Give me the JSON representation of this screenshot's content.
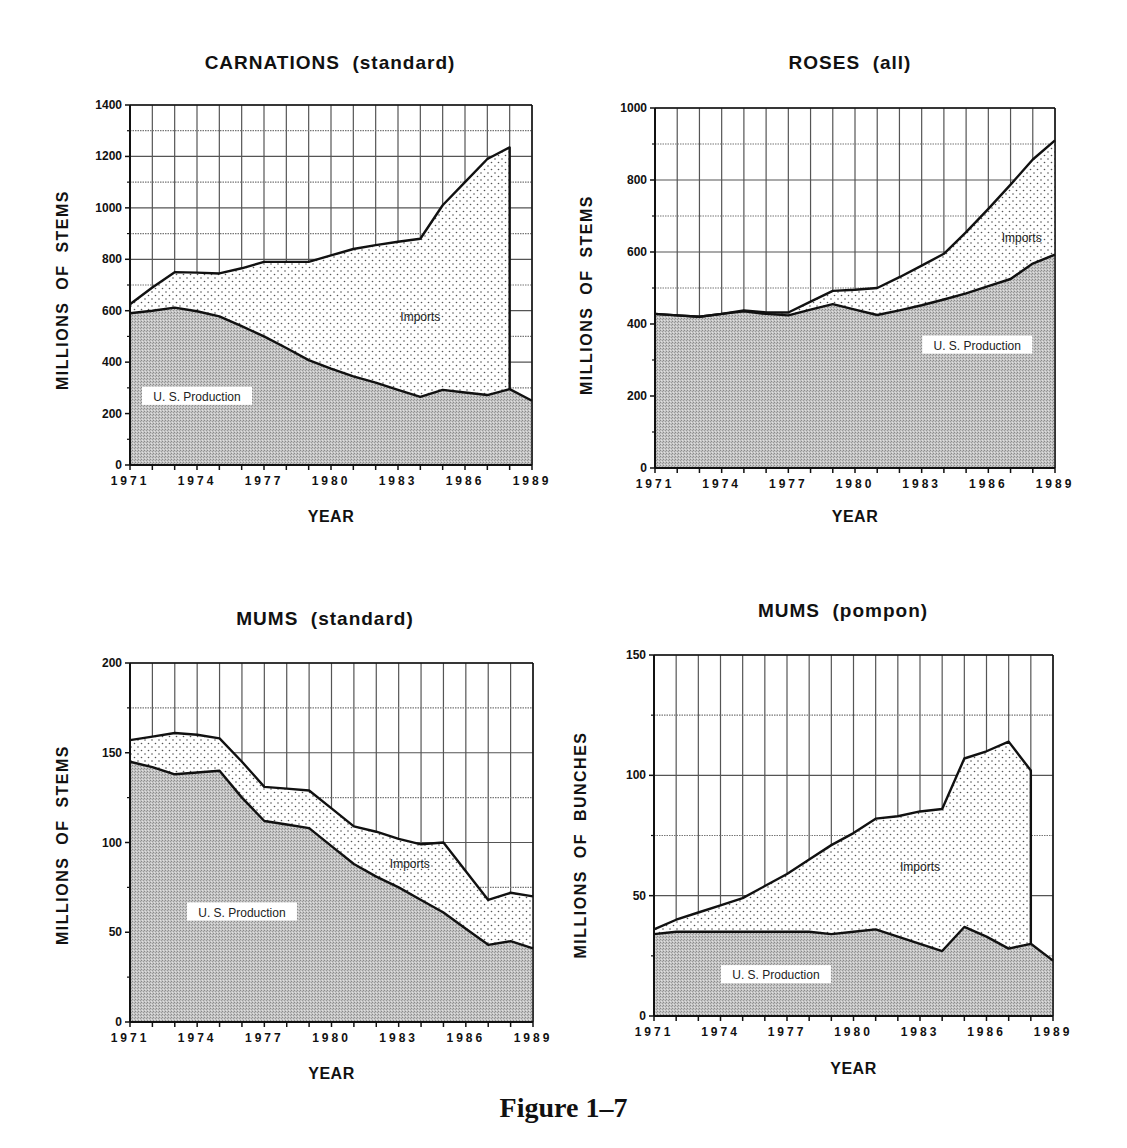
{
  "figure": {
    "caption": "Figure 1–7"
  },
  "labels": {
    "us_production": "U. S. Production",
    "imports": "Imports"
  },
  "chart_data": [
    {
      "id": "carnations",
      "type": "area",
      "stacked": true,
      "title": "CARNATIONS  (standard)",
      "xlabel": "YEAR",
      "ylabel": "MILLIONS  OF  STEMS",
      "x": [
        1971,
        1972,
        1973,
        1974,
        1975,
        1976,
        1977,
        1978,
        1979,
        1980,
        1981,
        1982,
        1983,
        1984,
        1985,
        1986,
        1987,
        1988,
        1989
      ],
      "xticks": [
        "1971",
        "1974",
        "1977",
        "1980",
        "1983",
        "1986",
        "1989"
      ],
      "ylim": [
        0,
        1400
      ],
      "yticks": [
        0,
        200,
        400,
        600,
        800,
        1000,
        1200,
        1400
      ],
      "grid": true,
      "series": [
        {
          "name": "U. S. Production",
          "fill": "stipple-gray",
          "values": [
            590,
            600,
            612,
            598,
            578,
            540,
            500,
            455,
            408,
            375,
            345,
            320,
            292,
            265,
            292,
            282,
            272,
            295,
            250
          ]
        },
        {
          "name": "Total (U. S. Production + Imports)",
          "fill": "dots",
          "values": [
            625,
            690,
            750,
            748,
            745,
            765,
            790,
            790,
            790,
            815,
            840,
            855,
            868,
            880,
            1010,
            1100,
            1190,
            1235,
            null
          ]
        }
      ],
      "annotations": [
        {
          "text": "Imports",
          "x": 1984,
          "y": 575
        },
        {
          "text": "U. S. Production",
          "x": 1974,
          "y": 265
        }
      ]
    },
    {
      "id": "roses",
      "type": "area",
      "stacked": true,
      "title": "ROSES  (all)",
      "xlabel": "YEAR",
      "ylabel": "MILLIONS  OF  STEMS",
      "x": [
        1971,
        1972,
        1973,
        1974,
        1975,
        1976,
        1977,
        1978,
        1979,
        1980,
        1981,
        1982,
        1983,
        1984,
        1985,
        1986,
        1987,
        1988,
        1989
      ],
      "xticks": [
        "1971",
        "1974",
        "1977",
        "1980",
        "1983",
        "1986",
        "1989"
      ],
      "ylim": [
        0,
        1000
      ],
      "yticks": [
        0,
        200,
        400,
        600,
        800,
        1000
      ],
      "grid": true,
      "series": [
        {
          "name": "U. S. Production",
          "fill": "stipple-gray",
          "values": [
            428,
            424,
            420,
            428,
            435,
            428,
            424,
            440,
            455,
            440,
            425,
            438,
            452,
            468,
            485,
            505,
            525,
            568,
            593
          ]
        },
        {
          "name": "Total (U. S. Production + Imports)",
          "fill": "dots",
          "values": [
            428,
            424,
            420,
            428,
            438,
            432,
            432,
            462,
            492,
            495,
            500,
            530,
            562,
            595,
            655,
            720,
            787,
            857,
            910
          ]
        }
      ],
      "annotations": [
        {
          "text": "Imports",
          "x": 1987.5,
          "y": 640
        },
        {
          "text": "U. S. Production",
          "x": 1985.5,
          "y": 340
        }
      ]
    },
    {
      "id": "mums-standard",
      "type": "area",
      "stacked": true,
      "title": "MUMS  (standard)",
      "xlabel": "YEAR",
      "ylabel": "MILLIONS  OF  STEMS",
      "x": [
        1971,
        1972,
        1973,
        1974,
        1975,
        1976,
        1977,
        1978,
        1979,
        1980,
        1981,
        1982,
        1983,
        1984,
        1985,
        1986,
        1987,
        1988,
        1989
      ],
      "xticks": [
        "1971",
        "1974",
        "1977",
        "1980",
        "1983",
        "1986",
        "1989"
      ],
      "ylim": [
        0,
        200
      ],
      "yticks": [
        0,
        50,
        100,
        150,
        200
      ],
      "grid": true,
      "series": [
        {
          "name": "U. S. Production",
          "fill": "stipple-gray",
          "values": [
            145,
            142,
            138,
            139,
            140,
            125,
            112,
            110,
            108,
            98,
            88,
            81,
            75,
            68,
            61,
            52,
            43,
            45,
            41
          ]
        },
        {
          "name": "Total (U. S. Production + Imports)",
          "fill": "dots",
          "values": [
            157,
            159,
            161,
            160,
            158,
            145,
            131,
            130,
            129,
            119,
            109,
            106,
            102,
            99,
            100,
            84,
            68,
            72,
            70
          ]
        }
      ],
      "annotations": [
        {
          "text": "Imports",
          "x": 1983.5,
          "y": 88
        },
        {
          "text": "U. S. Production",
          "x": 1976,
          "y": 61
        }
      ]
    },
    {
      "id": "mums-pompon",
      "type": "area",
      "stacked": true,
      "title": "MUMS  (pompon)",
      "xlabel": "YEAR",
      "ylabel": "MILLIONS  OF  BUNCHES",
      "x": [
        1971,
        1972,
        1973,
        1974,
        1975,
        1976,
        1977,
        1978,
        1979,
        1980,
        1981,
        1982,
        1983,
        1984,
        1985,
        1986,
        1987,
        1988,
        1989
      ],
      "xticks": [
        "1971",
        "1974",
        "1977",
        "1980",
        "1983",
        "1986",
        "1989"
      ],
      "ylim": [
        0,
        150
      ],
      "yticks": [
        0,
        50,
        100,
        150
      ],
      "grid": true,
      "series": [
        {
          "name": "U. S. Production",
          "fill": "stipple-gray",
          "values": [
            34,
            35,
            35,
            35,
            35,
            35,
            35,
            35,
            34,
            35,
            36,
            33,
            30,
            27,
            37,
            33,
            28,
            30,
            23
          ]
        },
        {
          "name": "Total (U. S. Production + Imports)",
          "fill": "dots",
          "values": [
            36,
            40,
            43,
            46,
            49,
            54,
            59,
            65,
            71,
            76,
            82,
            83,
            85,
            86,
            107,
            110,
            114,
            102,
            null
          ]
        }
      ],
      "annotations": [
        {
          "text": "Imports",
          "x": 1983,
          "y": 62
        },
        {
          "text": "U. S. Production",
          "x": 1976.5,
          "y": 17
        }
      ]
    }
  ],
  "layout": [
    {
      "left": 130,
      "top": 105,
      "right": 532,
      "bottom": 465,
      "title_cx": 330,
      "title_y": 52,
      "ylabel_cx": 64,
      "ylabel_cy": 290,
      "xlabel_y": 508,
      "minor_y": [
        100,
        300,
        500,
        700,
        900,
        1100,
        1300
      ],
      "vgrid_to": 1989
    },
    {
      "left": 655,
      "top": 108,
      "right": 1055,
      "bottom": 468,
      "title_cx": 850,
      "title_y": 52,
      "ylabel_cx": 588,
      "ylabel_cy": 295,
      "xlabel_y": 508,
      "minor_y": [
        100,
        300,
        500,
        700,
        900
      ],
      "vgrid_to": 1989
    },
    {
      "left": 130,
      "top": 663,
      "right": 533,
      "bottom": 1022,
      "title_cx": 325,
      "title_y": 608,
      "ylabel_cx": 64,
      "ylabel_cy": 845,
      "xlabel_y": 1065,
      "minor_y": [
        25,
        75,
        125,
        175
      ],
      "vgrid_to": 1989
    },
    {
      "left": 654,
      "top": 655,
      "right": 1053,
      "bottom": 1016,
      "title_cx": 843,
      "title_y": 600,
      "ylabel_cx": 582,
      "ylabel_cy": 845,
      "xlabel_y": 1060,
      "minor_y": [
        25,
        75,
        125
      ],
      "vgrid_to": 1989
    }
  ]
}
